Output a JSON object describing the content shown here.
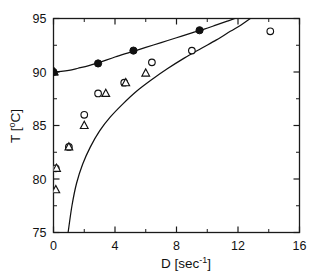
{
  "chart_data": {
    "type": "scatter",
    "title": "",
    "xlabel": "D [sec-1]",
    "xlabel_base": "D [sec",
    "xlabel_sup": "-1",
    "xlabel_tail": "]",
    "ylabel": "T [oC]",
    "ylabel_base": "T [",
    "ylabel_sup": "o",
    "ylabel_tail": "C]",
    "xlim": [
      0,
      16
    ],
    "ylim": [
      75,
      95
    ],
    "xticks": [
      0,
      4,
      8,
      12,
      16
    ],
    "xtick_labels": [
      "0",
      "4",
      "8",
      "12",
      "16"
    ],
    "xticks_minor": [
      2,
      6,
      10,
      14
    ],
    "yticks": [
      75,
      80,
      85,
      90,
      95
    ],
    "ytick_labels": [
      "75",
      "80",
      "85",
      "90",
      "95"
    ],
    "yticks_minor": [
      77.5,
      82.5,
      87.5,
      92.5
    ],
    "grid": false,
    "legend": "none",
    "series": [
      {
        "name": "filled-circle",
        "marker": "filled-circle",
        "points": [
          [
            0,
            90.0
          ],
          [
            2.9,
            90.8
          ],
          [
            5.2,
            92.0
          ],
          [
            9.5,
            93.9
          ]
        ]
      },
      {
        "name": "filled-triangle",
        "marker": "filled-triangle",
        "points": [
          [
            0.05,
            90.0
          ]
        ]
      },
      {
        "name": "open-circle",
        "marker": "open-circle",
        "points": [
          [
            0.15,
            81.0
          ],
          [
            1.0,
            83.0
          ],
          [
            2.0,
            86.0
          ],
          [
            2.9,
            88.0
          ],
          [
            4.6,
            89.0
          ],
          [
            6.4,
            90.9
          ],
          [
            9.0,
            92.0
          ],
          [
            14.1,
            93.8
          ]
        ]
      },
      {
        "name": "open-triangle",
        "marker": "open-triangle",
        "points": [
          [
            0.15,
            79.0
          ],
          [
            0.2,
            81.0
          ],
          [
            1.0,
            83.0
          ],
          [
            2.0,
            85.0
          ],
          [
            3.4,
            88.0
          ],
          [
            4.7,
            89.0
          ],
          [
            6.0,
            89.9
          ]
        ]
      }
    ],
    "curves": [
      {
        "name": "upper-boundary-curve",
        "points": [
          [
            0,
            90.0
          ],
          [
            0.5,
            90.05
          ],
          [
            1.0,
            90.15
          ],
          [
            1.6,
            90.35
          ],
          [
            2.3,
            90.6
          ],
          [
            3.0,
            90.9
          ],
          [
            4.0,
            91.4
          ],
          [
            5.0,
            91.85
          ],
          [
            6.0,
            92.3
          ],
          [
            7.0,
            92.75
          ],
          [
            8.0,
            93.2
          ],
          [
            9.0,
            93.65
          ],
          [
            9.8,
            94.0
          ],
          [
            10.6,
            94.4
          ],
          [
            11.3,
            94.75
          ],
          [
            11.8,
            95.0
          ]
        ]
      },
      {
        "name": "lower-boundary-curve",
        "points": [
          [
            0.95,
            75.0
          ],
          [
            1.2,
            77.5
          ],
          [
            1.5,
            79.6
          ],
          [
            1.9,
            81.4
          ],
          [
            2.4,
            83.0
          ],
          [
            3.0,
            84.5
          ],
          [
            3.7,
            85.8
          ],
          [
            4.5,
            87.0
          ],
          [
            5.4,
            88.2
          ],
          [
            6.4,
            89.3
          ],
          [
            7.4,
            90.3
          ],
          [
            8.5,
            91.3
          ],
          [
            9.6,
            92.2
          ],
          [
            10.6,
            93.0
          ],
          [
            11.5,
            93.8
          ],
          [
            12.2,
            94.4
          ],
          [
            12.8,
            95.0
          ]
        ]
      }
    ]
  }
}
